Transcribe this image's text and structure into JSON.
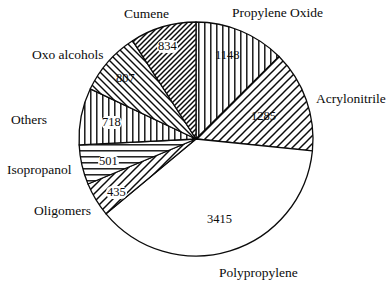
{
  "chart_data": {
    "type": "pie",
    "title": "",
    "subtitle": "",
    "xlabel": "",
    "ylabel": "",
    "legend_position": "none",
    "grid": false,
    "total": 9143,
    "units": "",
    "start_angle_deg": 0,
    "direction": "clockwise",
    "categories": [
      "Propylene Oxide",
      "Acrylonitrile",
      "Polypropylene",
      "Oligomers",
      "Isopropanol",
      "Others",
      "Oxo alcohols",
      "Cumene"
    ],
    "values": [
      1148,
      1285,
      3415,
      435,
      501,
      718,
      807,
      834
    ],
    "slices": [
      {
        "label": "Propylene Oxide",
        "value": 1148,
        "value_text": "1148",
        "fill": "vertical-lines",
        "label_x": 232,
        "label_y": 6,
        "value_x": 215,
        "value_y": 49,
        "boxed": false
      },
      {
        "label": "Acrylonitrile",
        "value": 1285,
        "value_text": "1285",
        "fill": "diagonal-forward",
        "label_x": 316,
        "label_y": 92,
        "value_x": 251,
        "value_y": 110,
        "boxed": false
      },
      {
        "label": "Polypropylene",
        "value": 3415,
        "value_text": "3415",
        "fill": "none",
        "label_x": 219,
        "label_y": 266,
        "value_x": 207,
        "value_y": 213,
        "boxed": false
      },
      {
        "label": "Oligomers",
        "value": 435,
        "value_text": "435",
        "fill": "diagonal-forward",
        "label_x": 34,
        "label_y": 204,
        "value_x": 106,
        "value_y": 186,
        "boxed": true
      },
      {
        "label": "Isopropanol",
        "value": 501,
        "value_text": "501",
        "fill": "horizontal-lines",
        "label_x": 7,
        "label_y": 163,
        "value_x": 98,
        "value_y": 155,
        "boxed": true
      },
      {
        "label": "Others",
        "value": 718,
        "value_text": "718",
        "fill": "vertical-lines",
        "label_x": 11,
        "label_y": 113,
        "value_x": 101,
        "value_y": 116,
        "boxed": true
      },
      {
        "label": "Oxo alcohols",
        "value": 807,
        "value_text": "807",
        "fill": "diagonal-back",
        "label_x": 32,
        "label_y": 48,
        "value_x": 116,
        "value_y": 72,
        "boxed": false
      },
      {
        "label": "Cumene",
        "value": 834,
        "value_text": "834",
        "fill": "diagonal-forward-dense",
        "label_x": 124,
        "label_y": 7,
        "value_x": 157,
        "value_y": 40,
        "boxed": true
      }
    ],
    "geometry": {
      "center_x": 196,
      "center_y": 139,
      "radius": 117
    },
    "colors": {
      "stroke": "#0b0b0b",
      "background": "#ffffff",
      "text": "#0b0b0b"
    }
  }
}
